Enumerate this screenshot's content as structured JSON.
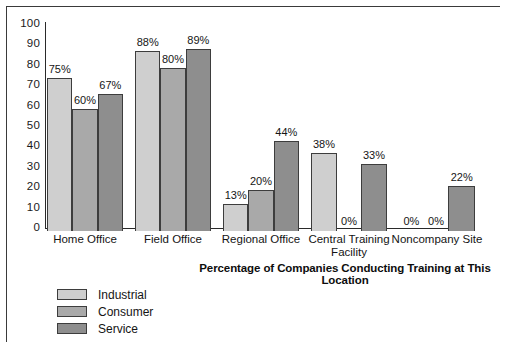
{
  "chart_data": {
    "type": "bar",
    "title": "",
    "xlabel": "Percentage of Companies Conducting Training at This Location",
    "ylabel": "",
    "ylim": [
      0,
      100
    ],
    "ytick_labels": [
      "100",
      "90",
      "80",
      "70",
      "60",
      "50",
      "40",
      "30",
      "20",
      "10",
      "0"
    ],
    "yticks": [
      100,
      90,
      80,
      70,
      60,
      50,
      40,
      30,
      20,
      10,
      0
    ],
    "grid": false,
    "legend_position": "bottom-left",
    "categories": [
      "Home Office",
      "Field Office",
      "Regional Office",
      "Central Training\nFacility",
      "Noncompany Site"
    ],
    "series": [
      {
        "name": "Industrial",
        "color": "#cfcfcf",
        "values": [
          75,
          88,
          13,
          38,
          0
        ],
        "labels": [
          "75%",
          "88%",
          "13%",
          "38%",
          "0%"
        ]
      },
      {
        "name": "Consumer",
        "color": "#a9a9a9",
        "values": [
          60,
          80,
          20,
          0,
          0
        ],
        "labels": [
          "60%",
          "80%",
          "20%",
          "0%",
          "0%"
        ]
      },
      {
        "name": "Service",
        "color": "#8e8e8e",
        "values": [
          67,
          89,
          44,
          33,
          22
        ],
        "labels": [
          "67%",
          "89%",
          "44%",
          "33%",
          "22%"
        ]
      }
    ]
  },
  "colors": {
    "industrial": "#cfcfcf",
    "consumer": "#a9a9a9",
    "service": "#8e8e8e",
    "outline": "#3d3d3d",
    "axis": "#2a2a2a",
    "frame": "#3a3a3a",
    "text": "#141414",
    "background": "#ffffff"
  }
}
